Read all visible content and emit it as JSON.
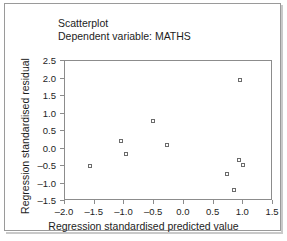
{
  "figure": {
    "title": "Scatterplot",
    "subtitle": "Dependent variable: MATHS"
  },
  "chart_data": {
    "type": "scatter",
    "title": "Scatterplot",
    "subtitle": "Dependent variable: MATHS",
    "xlabel": "Regression standardised predicted value",
    "ylabel": "Regression standardised residual",
    "xlim": [
      -2.0,
      1.5
    ],
    "ylim": [
      -1.5,
      2.5
    ],
    "xticks": [
      -2.0,
      -1.5,
      -1.0,
      -0.5,
      0.0,
      0.5,
      1.0,
      1.5
    ],
    "xticklabels": [
      "–2.0",
      "–1.5",
      "–1.0",
      "–0.5",
      "0.0",
      "0.5",
      "1.0",
      "1.5"
    ],
    "yticks": [
      -1.5,
      -1.0,
      -0.5,
      0.0,
      0.5,
      1.0,
      1.5,
      2.0,
      2.5
    ],
    "yticklabels": [
      "–1.5",
      "–1.0",
      "–0.5",
      "0.0",
      "0.5",
      "1.0",
      "1.5",
      "2.0",
      "2.5"
    ],
    "grid": false,
    "legend": null,
    "marker": "open-square",
    "marker_color": "#6b6b6b",
    "points": [
      {
        "x": -1.58,
        "y": -0.5
      },
      {
        "x": -1.06,
        "y": 0.21
      },
      {
        "x": -0.98,
        "y": -0.15
      },
      {
        "x": -0.52,
        "y": 0.78
      },
      {
        "x": -0.29,
        "y": 0.11
      },
      {
        "x": 0.72,
        "y": -0.72
      },
      {
        "x": 0.85,
        "y": -1.18
      },
      {
        "x": 0.93,
        "y": -0.33
      },
      {
        "x": 0.95,
        "y": 1.95
      },
      {
        "x": 0.99,
        "y": -0.48
      }
    ]
  }
}
